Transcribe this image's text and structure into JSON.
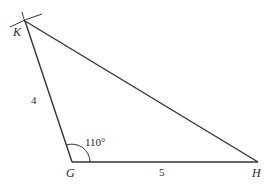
{
  "diagram": {
    "type": "triangle",
    "vertices": [
      {
        "name": "K",
        "label": "K"
      },
      {
        "name": "G",
        "label": "G"
      },
      {
        "name": "H",
        "label": "H"
      }
    ],
    "sides": [
      {
        "between": "K-G",
        "label": "4"
      },
      {
        "between": "G-H",
        "label": "5"
      }
    ],
    "angles": [
      {
        "at": "G",
        "label": "110°"
      }
    ],
    "colors": {
      "line": "#333333",
      "text": "#2a2a2a",
      "background": "#ffffff"
    }
  }
}
